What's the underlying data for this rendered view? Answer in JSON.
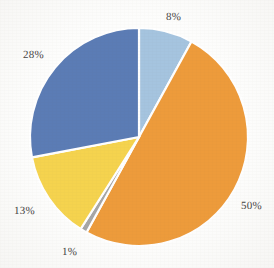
{
  "chart_data": {
    "type": "pie",
    "title": "",
    "categories": [
      "8%",
      "50%",
      "1%",
      "13%",
      "28%"
    ],
    "values": [
      8,
      50,
      1,
      13,
      28
    ],
    "labels": [
      "8%",
      "50%",
      "1%",
      "13%",
      "28%"
    ],
    "colors": [
      "#a5c4df",
      "#ed9b3b",
      "#a6a6a6",
      "#f5d34e",
      "#5b7cb5"
    ],
    "start_angle_deg": 0,
    "direction": "clockwise",
    "slice_gap_color": "#ffffff",
    "legend": "none",
    "grid": false,
    "xlabel": "",
    "ylabel": "",
    "slices": [
      {
        "label": "8%",
        "value": 8,
        "color": "#a5c4df",
        "label_x": 166,
        "label_y": 12
      },
      {
        "label": "50%",
        "value": 50,
        "color": "#ed9b3b",
        "label_x": 241,
        "label_y": 201
      },
      {
        "label": "1%",
        "value": 1,
        "color": "#a6a6a6",
        "label_x": 62,
        "label_y": 247
      },
      {
        "label": "13%",
        "value": 13,
        "color": "#f5d34e",
        "label_x": 14,
        "label_y": 206
      },
      {
        "label": "28%",
        "value": 28,
        "color": "#5b7cb5",
        "label_x": 23,
        "label_y": 50
      }
    ]
  },
  "geometry": {
    "center_x": 139,
    "center_y": 137,
    "radius": 109
  },
  "style": {
    "background_color": "#fdfdfc",
    "label_color": "#43423f"
  }
}
